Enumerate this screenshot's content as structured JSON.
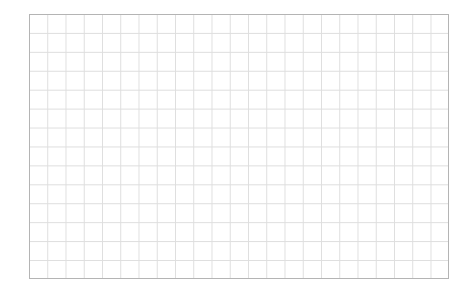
{
  "grid": {
    "columns": 23,
    "rows": 14,
    "border_color": "#b4b4b4",
    "line_color": "#dedede",
    "background_color": "#ffffff"
  }
}
